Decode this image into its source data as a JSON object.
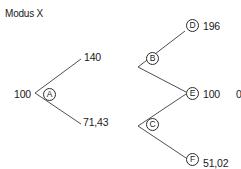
{
  "title": "Modus X",
  "tree": {
    "root": {
      "value": "100"
    },
    "nodes": {
      "A": {
        "label": "A"
      },
      "B": {
        "label": "B"
      },
      "C": {
        "label": "C"
      },
      "D": {
        "label": "D",
        "value": "196"
      },
      "E": {
        "label": "E",
        "value": "100"
      },
      "F": {
        "label": "F",
        "value": "51,02"
      }
    },
    "first_level": {
      "up_value": "140",
      "down_value": "71,43"
    },
    "truncated_right": "0"
  },
  "colors": {
    "line": "#3a3a3a",
    "text": "#1a1a1a",
    "background": "#ffffff"
  }
}
